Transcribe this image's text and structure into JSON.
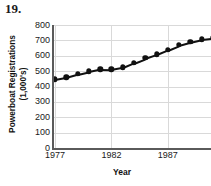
{
  "problem": {
    "number": "19."
  },
  "chart_data": {
    "type": "line",
    "title": "",
    "xlabel": "Year",
    "ylabel": "Powerboat Registrations (1,000's)",
    "ylabel_line1": "Powerboat Registrations",
    "ylabel_line2": "(1,000's)",
    "ylim": [
      0,
      800
    ],
    "xlim": [
      1977,
      1992
    ],
    "yticks": [
      0,
      100,
      200,
      300,
      400,
      500,
      600,
      700,
      800
    ],
    "ytick_labels": [
      "0",
      "100",
      "200",
      "300",
      "400",
      "500",
      "600",
      "700",
      "800"
    ],
    "xticks": [
      1977,
      1982,
      1987
    ],
    "xtick_labels": [
      "1977",
      "1982",
      "1987"
    ],
    "grid": true,
    "legend": null,
    "marker": "filled-circle",
    "series_color": "#111111",
    "grid_color": "#d9d9d9",
    "axis_color": "#5a5a5a",
    "x": [
      1977,
      1978,
      1979,
      1980,
      1981,
      1982,
      1983,
      1984,
      1985,
      1986,
      1987,
      1988,
      1989,
      1990,
      1991,
      1992
    ],
    "values": [
      447,
      460,
      481,
      498,
      513,
      512,
      525,
      556,
      585,
      614,
      645,
      675,
      760,
      672,
      706,
      716
    ],
    "points": [
      {
        "year": 1977,
        "value": 447
      },
      {
        "year": 1978,
        "value": 460
      },
      {
        "year": 1979,
        "value": 481
      },
      {
        "year": 1980,
        "value": 498
      },
      {
        "year": 1981,
        "value": 513
      },
      {
        "year": 1982,
        "value": 512
      },
      {
        "year": 1983,
        "value": 525
      },
      {
        "year": 1984,
        "value": 556
      },
      {
        "year": 1985,
        "value": 585
      },
      {
        "year": 1986,
        "value": 610
      },
      {
        "year": 1987,
        "value": 640
      },
      {
        "year": 1988,
        "value": 670
      },
      {
        "year": 1989,
        "value": 690
      },
      {
        "year": 1990,
        "value": 707
      },
      {
        "year": 1991,
        "value": 716
      },
      {
        "year": 1992,
        "value": 716
      }
    ]
  }
}
